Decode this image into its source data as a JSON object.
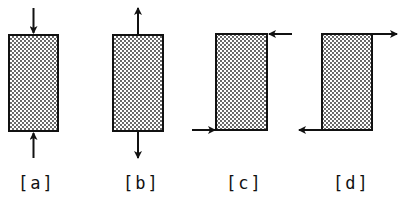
{
  "diagram": {
    "panels": [
      {
        "id": "a",
        "label": "[a]",
        "load": "compression",
        "arrows": "axial inward at top and bottom centers"
      },
      {
        "id": "b",
        "label": "[b]",
        "load": "tension",
        "arrows": "axial outward at top and bottom centers"
      },
      {
        "id": "c",
        "label": "[c]",
        "load": "shear",
        "arrows": "top-right pointing left, bottom-left pointing right"
      },
      {
        "id": "d",
        "label": "[d]",
        "load": "shear",
        "arrows": "top-right pointing right, bottom-left pointing left"
      }
    ],
    "colors": {
      "stroke": "#111111",
      "fill": "#ffffff",
      "dots": "#222222"
    }
  }
}
